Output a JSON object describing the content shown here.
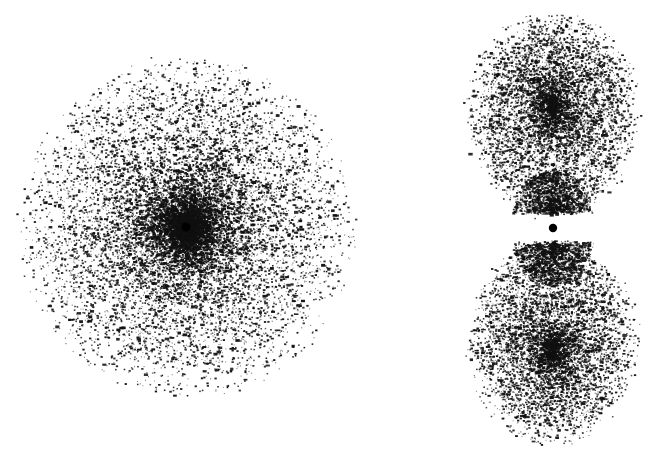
{
  "figure": {
    "title": "",
    "caption": "",
    "background_color": "#ffffff",
    "dot_color": "#111111",
    "nucleus_color": "#000000",
    "width": 667,
    "height": 471
  },
  "ghost_artifacts": {
    "note": "faint bleed-through scan artifacts, illegible",
    "color": "#fafafa",
    "lines": [
      {
        "text": "· · ·  ·· · ··· ·· ····",
        "x": 24,
        "y": 3
      },
      {
        "text": "·  ·  ··  ···   ··  ···",
        "x": 18,
        "y": 26
      }
    ]
  },
  "panels": [
    {
      "id": "left-orbital",
      "name": "spherical-density-cloud",
      "label": "",
      "shape": "sphere",
      "center_x": 187,
      "center_y": 228,
      "radius_x": 166,
      "radius_y": 168,
      "dot_count": 17000,
      "nucleus_radius": 4.6,
      "core_concentration": 1.75,
      "streak_count": 18
    },
    {
      "id": "right-orbital",
      "name": "dumbbell-density-cloud",
      "label": "",
      "shape": "dumbbell",
      "center_x": 553,
      "center_y": 228,
      "lobe_radius_x": 87,
      "lobe_radius_y": 107,
      "upper_lobe_center_y": 120,
      "lower_lobe_center_y": 337,
      "dot_count": 15000,
      "nucleus_radius": 4.2,
      "node_gap": 10
    }
  ],
  "chart_data": {
    "type": "scatter",
    "subtitle": "",
    "xlabel": "",
    "ylabel": "",
    "grid": false,
    "legend": "none",
    "xlim": [
      0,
      667
    ],
    "ylim": [
      0,
      471
    ],
    "series": [
      {
        "name": "s-orbital density cloud",
        "marker": "dot",
        "color": "#111111",
        "distribution": "radial-exponential",
        "center": [
          187,
          228
        ],
        "extent_x": [
          22,
          353
        ],
        "extent_y": [
          60,
          396
        ],
        "n_points": 17000,
        "peak_density_at": [
          187,
          228
        ],
        "nucleus_marker": {
          "x": 186,
          "y": 227,
          "r": 4.6,
          "color": "#000000"
        }
      },
      {
        "name": "p-orbital density cloud (upper lobe)",
        "marker": "dot",
        "color": "#111111",
        "distribution": "lobe-exponential",
        "center": [
          553,
          120
        ],
        "extent_x": [
          468,
          640
        ],
        "extent_y": [
          15,
          222
        ],
        "n_points": 7500,
        "peak_density_at": [
          553,
          200
        ],
        "nucleus_marker": null
      },
      {
        "name": "p-orbital density cloud (lower lobe)",
        "marker": "dot",
        "color": "#111111",
        "distribution": "lobe-exponential",
        "center": [
          553,
          337
        ],
        "extent_x": [
          468,
          641
        ],
        "extent_y": [
          236,
          456
        ],
        "n_points": 7500,
        "peak_density_at": [
          553,
          258
        ],
        "nucleus_marker": null
      },
      {
        "name": "p-orbital nucleus",
        "marker": "filled-circle",
        "color": "#000000",
        "n_points": 1,
        "nucleus_marker": {
          "x": 553,
          "y": 228,
          "r": 4.2,
          "color": "#000000"
        }
      }
    ],
    "annotations": []
  }
}
